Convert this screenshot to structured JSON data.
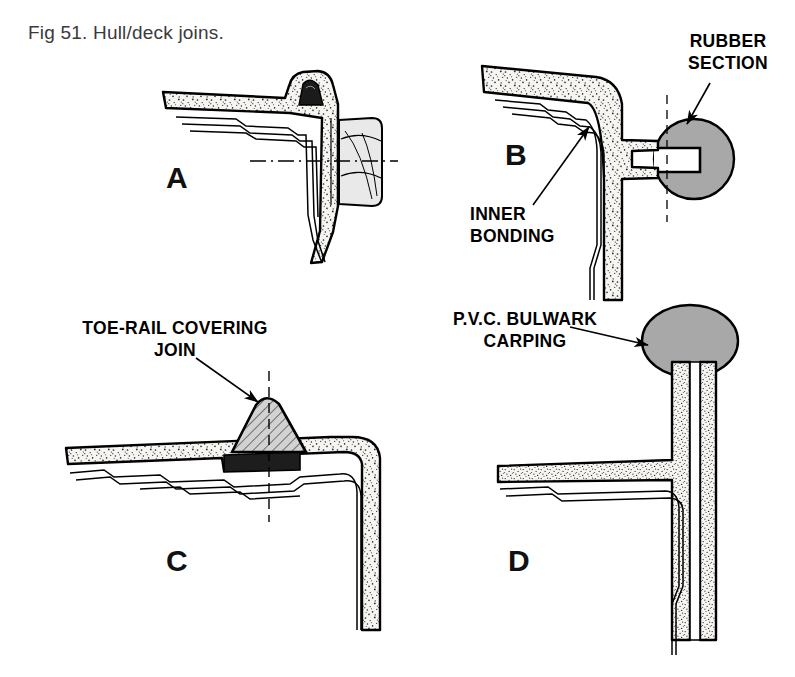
{
  "figure": {
    "caption": "Fig 51. Hull/deck joins.",
    "background_color": "#ffffff",
    "ink_color": "#000000",
    "stipple_fill_color": "#f2f0ec",
    "grey_fill_color": "#a6a6a6",
    "hatch_fill_color": "#c9c9c9"
  },
  "panels": [
    {
      "id": "A",
      "letter": "A",
      "description": "Hull/deck join with bolted toe-rail and external rubber fender"
    },
    {
      "id": "B",
      "letter": "B",
      "description": "Hull/deck join with round rubber section grip and inner bonding"
    },
    {
      "id": "C",
      "letter": "C",
      "description": "Hull/deck join with toe-rail covering the join"
    },
    {
      "id": "D",
      "letter": "D",
      "description": "Hull/deck join with bulwark and P.V.C. capping"
    }
  ],
  "callouts": {
    "rubber_section": {
      "line1": "RUBBER",
      "line2": "SECTION"
    },
    "inner_bonding": {
      "line1": "INNER",
      "line2": "BONDING"
    },
    "toe_rail": {
      "line1": "TOE-RAIL COVERING",
      "line2": "JOIN"
    },
    "pvc_capping": {
      "line1": "P.V.C. BULWARK",
      "line2": "CARPING"
    }
  }
}
